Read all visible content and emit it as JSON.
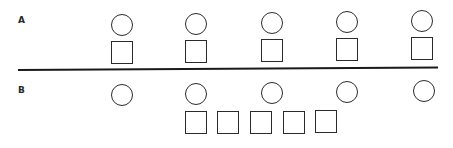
{
  "diagram": {
    "type": "one-to-one correspondence comparison",
    "stroke_color": "#2b2b2b",
    "background_color": "#ffffff",
    "rows": [
      {
        "label": "A",
        "circles": 5,
        "squares": 5,
        "arrangement": "each square directly beneath a circle"
      },
      {
        "label": "B",
        "circles": 5,
        "squares": 5,
        "arrangement": "squares bunched together beneath the middle circles"
      }
    ]
  }
}
